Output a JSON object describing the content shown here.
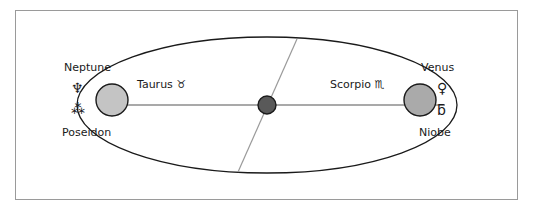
{
  "figure": {
    "type": "orbital-ellipse-diagram",
    "background_color": "#ffffff",
    "border_color": "#9a9a9a"
  },
  "diagram": {
    "ellipse": {
      "stroke": "#1a1a1a",
      "fill": "none",
      "center_x": 267,
      "center_y": 105,
      "radius_x": 190,
      "radius_y": 68
    },
    "major_axis_line": {
      "stroke": "#8c8c8c",
      "x1": 110,
      "y1": 105,
      "x2": 445,
      "y2": 105
    },
    "diagonal_line": {
      "stroke": "#9a9a9a",
      "x1": 297,
      "y1": 39,
      "x2": 238,
      "y2": 172
    },
    "center_body": {
      "name": "focus-point",
      "fill": "#595959",
      "stroke": "#1a1a1a",
      "cx": 267,
      "cy": 105,
      "r": 9
    },
    "left_body": {
      "name": "neptune-body",
      "fill": "#c4c4c4",
      "stroke": "#1a1a1a",
      "cx": 112,
      "cy": 100,
      "r": 16
    },
    "right_body": {
      "name": "venus-body",
      "fill": "#aaaaaa",
      "stroke": "#1a1a1a",
      "cx": 420,
      "cy": 100,
      "r": 16
    }
  },
  "labels": {
    "neptune": "Neptune",
    "neptune_glyph": "♆",
    "poseidon_glyph": "⁂",
    "poseidon": "Poseidon",
    "taurus": "Taurus  ♉",
    "scorpio": "Scorpio  ♏",
    "venus": "Venus",
    "venus_glyph": "♀",
    "niobe_glyph": "ƃ",
    "niobe": "Niobe"
  }
}
